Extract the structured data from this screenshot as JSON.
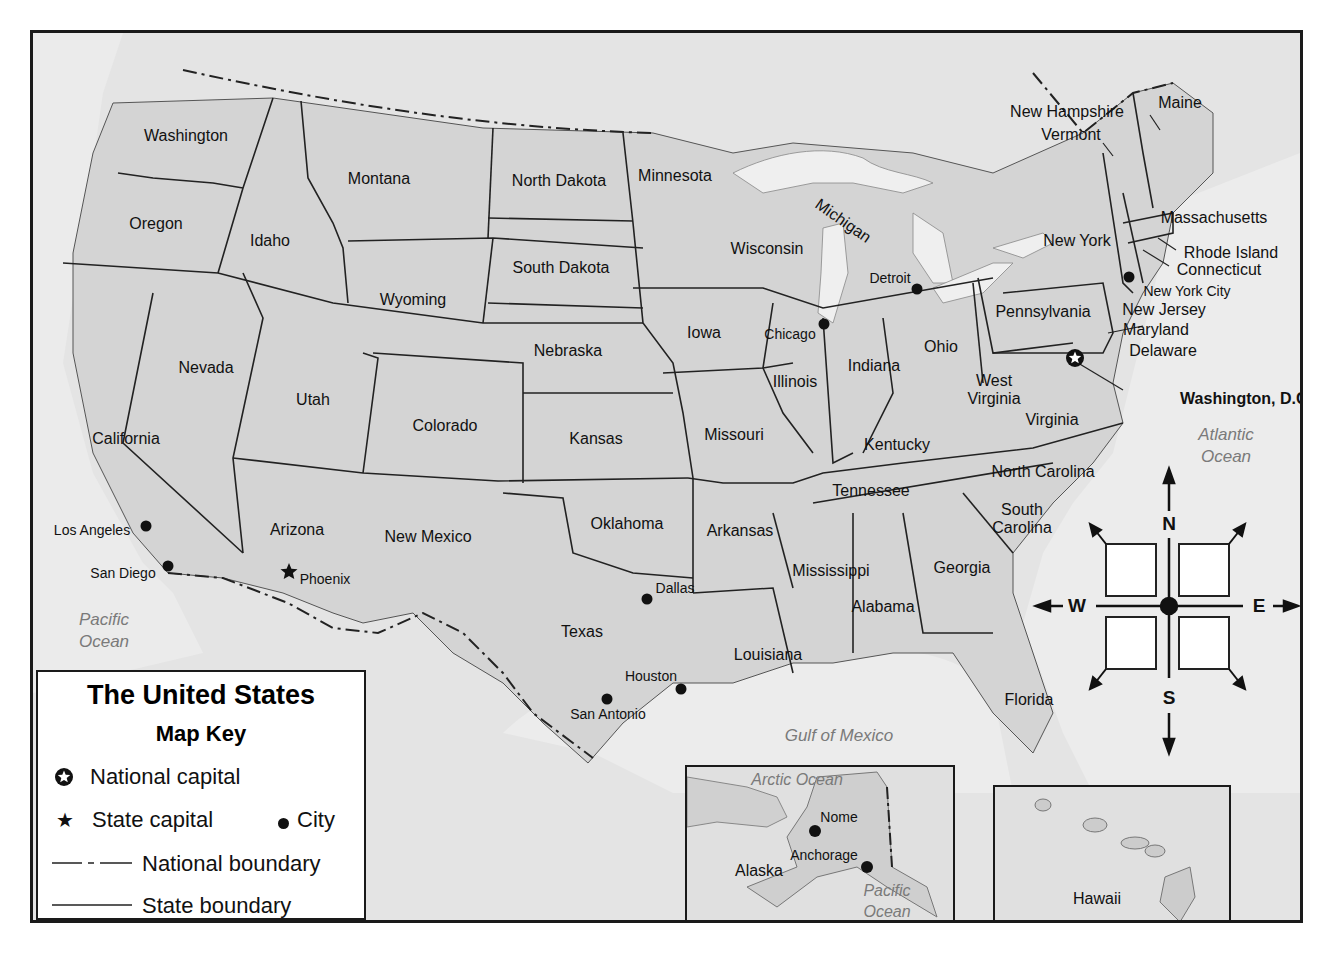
{
  "map": {
    "title": "The United States",
    "legend": {
      "heading": "Map Key",
      "items": [
        {
          "symbol": "national-capital",
          "label": "National capital"
        },
        {
          "symbol": "state-capital",
          "label": "State capital"
        },
        {
          "symbol": "city",
          "label": "City"
        },
        {
          "symbol": "national-boundary",
          "label": "National boundary"
        },
        {
          "symbol": "state-boundary",
          "label": "State boundary"
        }
      ]
    },
    "states": [
      {
        "name": "Washington",
        "x": 153,
        "y": 103
      },
      {
        "name": "Oregon",
        "x": 123,
        "y": 191
      },
      {
        "name": "Idaho",
        "x": 237,
        "y": 208
      },
      {
        "name": "Montana",
        "x": 346,
        "y": 146
      },
      {
        "name": "Wyoming",
        "x": 380,
        "y": 267
      },
      {
        "name": "North Dakota",
        "x": 526,
        "y": 148
      },
      {
        "name": "South Dakota",
        "x": 528,
        "y": 235
      },
      {
        "name": "Minnesota",
        "x": 642,
        "y": 143
      },
      {
        "name": "Nevada",
        "x": 173,
        "y": 335
      },
      {
        "name": "Utah",
        "x": 280,
        "y": 367
      },
      {
        "name": "Colorado",
        "x": 412,
        "y": 393
      },
      {
        "name": "Nebraska",
        "x": 535,
        "y": 318
      },
      {
        "name": "Iowa",
        "x": 671,
        "y": 300
      },
      {
        "name": "Wisconsin",
        "x": 734,
        "y": 216
      },
      {
        "name": "Michigan",
        "x": 810,
        "y": 188
      },
      {
        "name": "California",
        "x": 93,
        "y": 406
      },
      {
        "name": "Arizona",
        "x": 264,
        "y": 497
      },
      {
        "name": "New Mexico",
        "x": 395,
        "y": 504
      },
      {
        "name": "Kansas",
        "x": 563,
        "y": 406
      },
      {
        "name": "Missouri",
        "x": 701,
        "y": 402
      },
      {
        "name": "Illinois",
        "x": 762,
        "y": 349
      },
      {
        "name": "Indiana",
        "x": 841,
        "y": 333
      },
      {
        "name": "Ohio",
        "x": 908,
        "y": 314
      },
      {
        "name": "Kentucky",
        "x": 864,
        "y": 412
      },
      {
        "name": "West Virginia",
        "x": 961,
        "y": 357
      },
      {
        "name": "Virginia",
        "x": 1019,
        "y": 387
      },
      {
        "name": "Oklahoma",
        "x": 594,
        "y": 491
      },
      {
        "name": "Texas",
        "x": 549,
        "y": 599
      },
      {
        "name": "Arkansas",
        "x": 707,
        "y": 498
      },
      {
        "name": "Louisiana",
        "x": 735,
        "y": 622
      },
      {
        "name": "Tennessee",
        "x": 838,
        "y": 458
      },
      {
        "name": "Mississippi",
        "x": 798,
        "y": 538
      },
      {
        "name": "Alabama",
        "x": 850,
        "y": 574
      },
      {
        "name": "Georgia",
        "x": 929,
        "y": 535
      },
      {
        "name": "Florida",
        "x": 996,
        "y": 667
      },
      {
        "name": "North Carolina",
        "x": 1010,
        "y": 439
      },
      {
        "name": "South Carolina",
        "x": 989,
        "y": 486
      },
      {
        "name": "Pennsylvania",
        "x": 1010,
        "y": 279
      },
      {
        "name": "New York",
        "x": 1044,
        "y": 208
      },
      {
        "name": "New Jersey",
        "x": 1131,
        "y": 277
      },
      {
        "name": "Maryland",
        "x": 1123,
        "y": 297
      },
      {
        "name": "Delaware",
        "x": 1130,
        "y": 318
      },
      {
        "name": "Connecticut",
        "x": 1186,
        "y": 237
      },
      {
        "name": "Rhode Island",
        "x": 1198,
        "y": 220
      },
      {
        "name": "Massachusetts",
        "x": 1181,
        "y": 185
      },
      {
        "name": "Vermont",
        "x": 1038,
        "y": 102
      },
      {
        "name": "New Hampshire",
        "x": 1034,
        "y": 79
      },
      {
        "name": "Maine",
        "x": 1147,
        "y": 70
      }
    ],
    "cities": [
      {
        "name": "Los Angeles",
        "type": "city",
        "dot_x": 113,
        "dot_y": 493,
        "x": 59,
        "y": 497
      },
      {
        "name": "San Diego",
        "type": "city",
        "dot_x": 135,
        "dot_y": 533,
        "x": 90,
        "y": 540
      },
      {
        "name": "Phoenix",
        "type": "state-capital",
        "dot_x": 256,
        "dot_y": 538,
        "x": 292,
        "y": 546
      },
      {
        "name": "Dallas",
        "type": "city",
        "dot_x": 614,
        "dot_y": 566,
        "x": 642,
        "y": 555
      },
      {
        "name": "Houston",
        "type": "city",
        "dot_x": 648,
        "dot_y": 656,
        "x": 618,
        "y": 643
      },
      {
        "name": "San Antonio",
        "type": "city",
        "dot_x": 574,
        "dot_y": 666,
        "x": 575,
        "y": 681
      },
      {
        "name": "Chicago",
        "type": "city",
        "dot_x": 791,
        "dot_y": 291,
        "x": 757,
        "y": 301
      },
      {
        "name": "Detroit",
        "type": "city",
        "dot_x": 884,
        "dot_y": 256,
        "x": 857,
        "y": 245
      },
      {
        "name": "New York City",
        "type": "city",
        "dot_x": 1096,
        "dot_y": 244,
        "x": 1154,
        "y": 258
      },
      {
        "name": "Washington, D.C.",
        "type": "national-capital",
        "dot_x": 1042,
        "dot_y": 325,
        "x": 1213,
        "y": 366
      }
    ],
    "oceans": [
      {
        "name": "Pacific\nOcean",
        "x": 71,
        "y": 598
      },
      {
        "name": "Atlantic\nOcean",
        "x": 1193,
        "y": 413
      },
      {
        "name": "Gulf of Mexico",
        "x": 806,
        "y": 703
      }
    ],
    "insets": [
      {
        "name": "Alaska",
        "cities": [
          "Nome",
          "Anchorage"
        ],
        "oceans": [
          "Arctic Ocean",
          "Pacific\nOcean"
        ]
      },
      {
        "name": "Hawaii",
        "oceans": [
          "Pacific Ocean"
        ]
      }
    ],
    "compass": {
      "n": "N",
      "s": "S",
      "e": "E",
      "w": "W"
    }
  }
}
